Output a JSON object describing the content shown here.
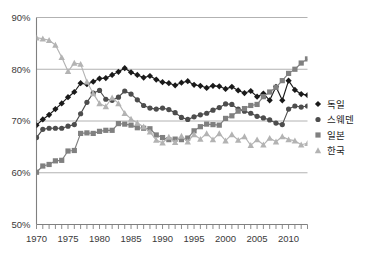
{
  "chart_data": {
    "type": "line",
    "title": "",
    "xlabel": "",
    "ylabel": "",
    "xlim": [
      1970,
      2013
    ],
    "ylim": [
      50,
      90
    ],
    "ytick_labels": [
      "50%",
      "60%",
      "70%",
      "80%",
      "90%"
    ],
    "ytick_values": [
      50,
      60,
      70,
      80,
      90
    ],
    "xtick_labels": [
      "1970",
      "1975",
      "1980",
      "1985",
      "1990",
      "1995",
      "2000",
      "2005",
      "2010"
    ],
    "xtick_values": [
      1970,
      1975,
      1980,
      1985,
      1990,
      1995,
      2000,
      2005,
      2010
    ],
    "minor_xticks_every": 1,
    "grid": "horizontal",
    "legend_position": "right",
    "x": [
      1970,
      1971,
      1972,
      1973,
      1974,
      1975,
      1976,
      1977,
      1978,
      1979,
      1980,
      1981,
      1982,
      1983,
      1984,
      1985,
      1986,
      1987,
      1988,
      1989,
      1990,
      1991,
      1992,
      1993,
      1994,
      1995,
      1996,
      1997,
      1998,
      1999,
      2000,
      2001,
      2002,
      2003,
      2004,
      2005,
      2006,
      2007,
      2008,
      2009,
      2010,
      2011,
      2012,
      2013
    ],
    "series": [
      {
        "name": "독일",
        "marker": "diamond",
        "color": "#1a1a1a",
        "values": [
          69.2,
          70.3,
          71.2,
          72.3,
          73.4,
          74.6,
          75.6,
          77.3,
          77.1,
          77.6,
          78.2,
          78.3,
          78.9,
          79.5,
          80.2,
          79.4,
          78.9,
          78.4,
          78.7,
          78.0,
          77.5,
          77.3,
          76.9,
          77.4,
          77.7,
          77.0,
          76.8,
          76.4,
          76.8,
          76.7,
          76.2,
          76.6,
          75.9,
          75.4,
          75.8,
          74.7,
          75.3,
          74.0,
          76.6,
          74.0,
          77.8,
          76.0,
          75.2,
          75.0
        ]
      },
      {
        "name": "스웨덴",
        "marker": "circle",
        "color": "#4d4d4d",
        "values": [
          66.8,
          68.4,
          68.6,
          68.6,
          68.6,
          69.0,
          69.3,
          71.4,
          73.6,
          75.4,
          75.9,
          74.2,
          74.0,
          74.6,
          75.8,
          75.2,
          74.1,
          73.0,
          72.5,
          72.3,
          72.5,
          72.2,
          71.6,
          70.7,
          70.3,
          70.8,
          71.2,
          71.5,
          72.1,
          72.6,
          73.3,
          73.2,
          72.3,
          71.9,
          71.5,
          70.9,
          70.6,
          70.2,
          69.6,
          69.3,
          72.3,
          72.9,
          72.7,
          72.9
        ]
      },
      {
        "name": "일본",
        "marker": "square",
        "color": "#808080",
        "values": [
          60.1,
          61.3,
          61.6,
          62.3,
          62.4,
          64.2,
          64.3,
          67.6,
          67.7,
          67.6,
          68.0,
          68.2,
          68.2,
          69.5,
          69.4,
          69.2,
          68.7,
          68.6,
          68.5,
          67.3,
          66.8,
          66.4,
          66.5,
          66.4,
          66.7,
          68.1,
          68.9,
          69.4,
          69.3,
          69.2,
          70.5,
          71.0,
          71.9,
          72.4,
          73.0,
          73.2,
          74.7,
          75.6,
          76.5,
          77.8,
          79.2,
          80.0,
          81.2,
          82.0
        ]
      },
      {
        "name": "한국",
        "marker": "triangle",
        "color": "#b3b3b3",
        "values": [
          86.1,
          85.9,
          85.6,
          84.7,
          82.3,
          79.6,
          81.2,
          81.0,
          77.6,
          75.3,
          73.4,
          72.8,
          74.5,
          73.4,
          71.5,
          70.4,
          69.6,
          68.9,
          67.9,
          66.3,
          65.8,
          66.9,
          65.9,
          67.1,
          66.0,
          67.4,
          66.5,
          67.6,
          66.4,
          67.6,
          66.2,
          67.4,
          66.3,
          67.0,
          65.3,
          66.4,
          65.4,
          66.7,
          66.0,
          67.0,
          66.4,
          66.2,
          65.4,
          65.7
        ]
      }
    ]
  },
  "legend": {
    "items": [
      {
        "label": "독일"
      },
      {
        "label": "스웨덴"
      },
      {
        "label": "일본"
      },
      {
        "label": "한국"
      }
    ]
  }
}
